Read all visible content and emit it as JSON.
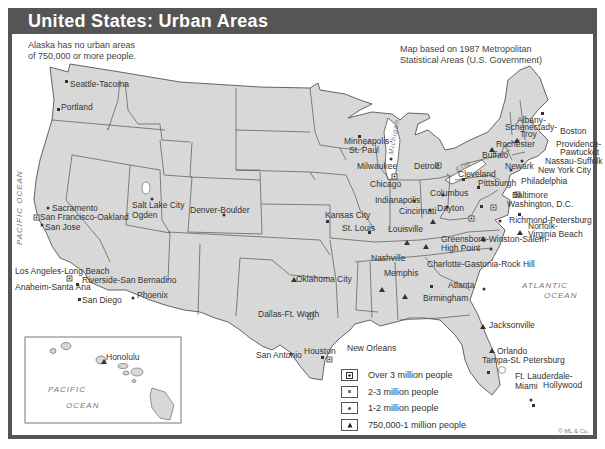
{
  "header": {
    "title": "United States: Urban Areas"
  },
  "notes": {
    "alaska_line1": "Alaska has no urban areas",
    "alaska_line2": "of 750,000 or more people.",
    "source_line1": "Map based on 1987 Metropolitan",
    "source_line2": "Statistical Areas (U.S. Government)"
  },
  "colors": {
    "land": "#d8d8d8",
    "border": "#555555",
    "title_bar": "#555555",
    "water": "#ffffff"
  },
  "oceans": {
    "pacific_west": "PACIFIC OCEAN",
    "atlantic_1": "ATLANTIC",
    "atlantic_2": "OCEAN",
    "lake_michigan": "Michigan",
    "lake_erie": "L. Erie",
    "hawaii_pacific_1": "PACIFIC",
    "hawaii_pacific_2": "OCEAN"
  },
  "cities": {
    "seattle": "Seattle-Tacoma",
    "portland": "Portland",
    "sacramento": "Sacramento",
    "sf_oakland": "San Francisco-Oakland",
    "san_jose": "San Jose",
    "slc_1": "Salt Lake City",
    "slc_2": "Ogden",
    "denver": "Denver-Boulder",
    "la": "Los Angeles-Long Beach",
    "riverside": "Riverside-San Bernadino",
    "anaheim": "Anaheim-Santa Ana",
    "san_diego": "San Diego",
    "phoenix": "Phoenix",
    "minneapolis_1": "Minneapolis-",
    "minneapolis_2": "St. Paul",
    "milwaukee": "Milwaukee",
    "chicago": "Chicago",
    "detroit": "Detroit",
    "kansas_city": "Kansas City",
    "st_louis": "St. Louis",
    "indianapolis": "Indianapolis",
    "columbus": "Columbus",
    "dayton": "Dayton",
    "cincinnati": "Cincinnati",
    "louisville": "Louisville",
    "cleveland": "Cleveland",
    "pittsburgh": "Pittsburgh",
    "buffalo": "Buffalo",
    "rochester": "Rochester",
    "albany_1": "Albany-",
    "albany_2": "Schenectady-",
    "albany_3": "Troy",
    "boston": "Boston",
    "providence_1": "Providence-",
    "providence_2": "Pawtucket",
    "nassau": "Nassau-Suffolk",
    "newark": "Newark",
    "nyc": "New York City",
    "philadelphia": "Philadelphia",
    "baltimore": "Baltimore",
    "washington": "Washington, D.C.",
    "richmond": "Richmond-Petersburg",
    "norfolk_1": "Norfolk-",
    "norfolk_2": "Virginia Beach",
    "greensboro_1": "Greensboro-Winston-Salem-",
    "greensboro_2": "High Point",
    "charlotte": "Charlotte-Gastonia-Rock Hill",
    "nashville": "Nashville",
    "memphis": "Memphis",
    "atlanta": "Atlanta",
    "birmingham": "Birmingham",
    "oklahoma_city": "Oklahoma City",
    "dallas": "Dallas-Ft. Worth",
    "houston": "Houston",
    "san_antonio": "San Antonio",
    "new_orleans": "New Orleans",
    "jacksonville": "Jacksonville",
    "orlando": "Orlando",
    "tampa": "Tampa-St. Petersburg",
    "ft_lauderdale_1": "Ft. Lauderdale-",
    "ft_lauderdale_2": "Hollywood",
    "miami": "Miami",
    "honolulu": "Honolulu"
  },
  "legend": [
    {
      "symbol": "square-dot",
      "label": "Over 3 million people"
    },
    {
      "symbol": "small-square",
      "label": "2-3 million people"
    },
    {
      "symbol": "dot",
      "label": "1-2 million people"
    },
    {
      "symbol": "triangle",
      "label": "750,000-1 million people"
    }
  ],
  "credit": "© ML & Co."
}
